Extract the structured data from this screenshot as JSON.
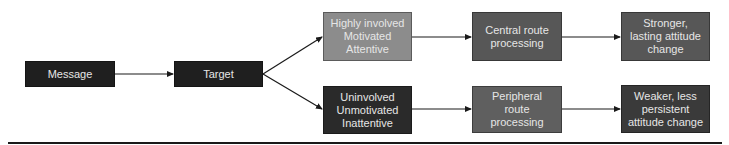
{
  "diagram": {
    "nodes": {
      "message": {
        "label": "Message",
        "color": "#1f1f1f"
      },
      "target": {
        "label": "Target",
        "color": "#1f1f1f"
      },
      "high_involvement": {
        "label": "Highly involved\nMotivated\nAttentive",
        "color": "#8c8c8c"
      },
      "low_involvement": {
        "label": "Uninvolved\nUnmotivated\nInattentive",
        "color": "#2a2a2a"
      },
      "central_route": {
        "label": "Central route\nprocessing",
        "color": "#575757"
      },
      "peripheral_route": {
        "label": "Peripheral\nroute\nprocessing",
        "color": "#5f5f5f"
      },
      "strong_change": {
        "label": "Stronger,\nlasting attitude\nchange",
        "color": "#575757"
      },
      "weak_change": {
        "label": "Weaker, less\npersistent\nattitude change",
        "color": "#3a3a3a"
      }
    },
    "edges": [
      {
        "from": "message",
        "to": "target"
      },
      {
        "from": "target",
        "to": "high_involvement"
      },
      {
        "from": "target",
        "to": "low_involvement"
      },
      {
        "from": "high_involvement",
        "to": "central_route"
      },
      {
        "from": "low_involvement",
        "to": "peripheral_route"
      },
      {
        "from": "central_route",
        "to": "strong_change"
      },
      {
        "from": "peripheral_route",
        "to": "weak_change"
      }
    ],
    "line_color": "#1a1a1a",
    "text_color": "#e6e6e6"
  }
}
